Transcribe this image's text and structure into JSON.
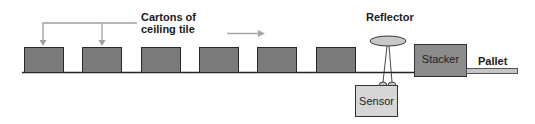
{
  "diagram": {
    "labels": {
      "cartons_line1": "Cartons of",
      "cartons_line2": "ceiling tile",
      "reflector": "Reflector",
      "stacker": "Stacker",
      "pallet": "Pallet",
      "sensor": "Sensor"
    },
    "cartons_count": 6,
    "colors": {
      "carton_fill": "#7a7a7a",
      "carton_stroke": "#2a2a2a",
      "conveyor": "#222222",
      "callout_arrow": "#a0a0a0",
      "stacker_fill": "#8c8c8c",
      "sensor_fill": "#d6d6d6",
      "reflector_fill": "#c8c8c8",
      "pallet_fill": "#c6c6c6"
    }
  }
}
